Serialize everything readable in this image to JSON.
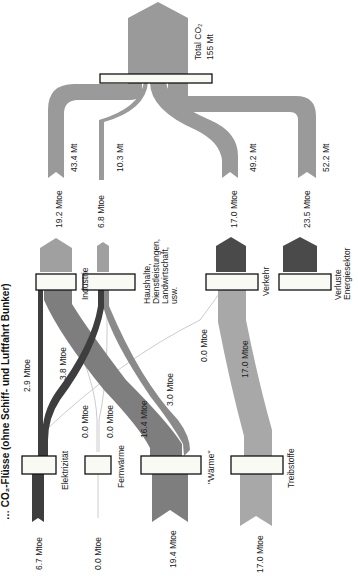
{
  "title": "… CO₂-Flüsse (ohne Schiff- und Luftfahrt Bunker)",
  "colors": {
    "co2_flow": "#9a9a9a",
    "dark_flow": "#4a4a4a",
    "medium_flow": "#7e7e7e",
    "light_flow": "#a8a8a8",
    "thin_line": "#cccccc",
    "node_fill": "#fafaf5",
    "node_border": "#111111"
  },
  "total": {
    "label": "Total CO₂",
    "value": "155 Mt"
  },
  "sectors": [
    {
      "name": "Industrie",
      "co2": "43.4 Mt",
      "energy": "19.2 Mtoe"
    },
    {
      "name": "Haushalte, Dienstleistungen, Landwirtschaft, usw.",
      "name_lines": [
        "Haushalte,",
        "Dienstleistungen,",
        "Landwirtschaft,",
        "usw."
      ],
      "co2": "10.3 Mt",
      "energy": "6.8 Mtoe"
    },
    {
      "name": "Verkehr",
      "co2": "49.2 Mt",
      "energy": "17.0 Mtoe"
    },
    {
      "name": "Verluste Energiesektor",
      "name_lines": [
        "Verluste",
        "Energiesektor"
      ],
      "co2": "52.2 Mt",
      "energy": "23.5 Mtoe"
    }
  ],
  "carriers": [
    {
      "name": "Elektrizität",
      "input": "6.7 Mtoe"
    },
    {
      "name": "Fernwärme",
      "input": "0.0 Mtoe"
    },
    {
      "name": "\"Wärme\"",
      "input": "19.4 Mtoe"
    },
    {
      "name": "Treibstoffe",
      "input": "17.0 Mtoe"
    }
  ],
  "flows": [
    {
      "from": "Elektrizität",
      "to": "Industrie",
      "label": "2.9 Mtoe"
    },
    {
      "from": "Elektrizität",
      "to": "Haushalte",
      "label": "3.8 Mtoe"
    },
    {
      "from": "Fernwärme",
      "to": "Industrie",
      "label": "0.0 Mtoe"
    },
    {
      "from": "Fernwärme",
      "to": "Haushalte",
      "label": "0.0 Mtoe"
    },
    {
      "from": "Wärme",
      "to": "Industrie",
      "label": "16.4 Mtoe"
    },
    {
      "from": "Wärme",
      "to": "Haushalte",
      "label": "3.0 Mtoe"
    },
    {
      "from": "Wärme",
      "to": "Verkehr",
      "label": "0.0 Mtoe"
    },
    {
      "from": "Treibstoffe",
      "to": "Verkehr",
      "label": "17.0 Mtoe"
    }
  ]
}
